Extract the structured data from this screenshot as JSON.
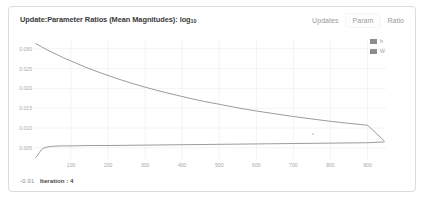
{
  "card": {
    "background": "#ffffff",
    "border_color": "#dcdcdc"
  },
  "header": {
    "title_main": "Update:Parameter Ratios (Mean Magnitudes): log",
    "title_subscript": "10",
    "tabs": [
      {
        "label": "Updates",
        "selected": false
      },
      {
        "label": "Param",
        "selected": true
      },
      {
        "label": "Ratio",
        "selected": false
      }
    ]
  },
  "legend": {
    "position": "top-right",
    "entries": [
      {
        "label": "b",
        "color": "#8c8c8c"
      },
      {
        "label": "W",
        "color": "#8c8c8c"
      }
    ]
  },
  "footer": {
    "value": "-0.91",
    "iteration_label": "Iteration : 4"
  },
  "colors": {
    "gridline": "#ebebeb",
    "axis_text": "#a8a8a8",
    "series_b": "#8f8f96",
    "series_w": "#8f8f96",
    "title_text": "#3a3a3a",
    "tab_text": "#9a9a9a"
  },
  "chart_data": {
    "type": "line",
    "title": "Update:Parameter Ratios (Mean Magnitudes): log10",
    "xlabel": "",
    "ylabel": "",
    "xlim": [
      0,
      950
    ],
    "ylim": [
      0.0022,
      0.0322
    ],
    "grid": true,
    "legend_position": "top-right",
    "xticks": [
      100,
      200,
      300,
      400,
      500,
      600,
      700,
      800,
      900
    ],
    "yticks": [
      0.005,
      0.01,
      0.015,
      0.02,
      0.025,
      0.03
    ],
    "ytick_labels": [
      "0.005",
      "0.010",
      "0.015",
      "0.020",
      "0.025",
      "0.030"
    ],
    "xtick_labels": [
      "100",
      "200",
      "300",
      "400",
      "500",
      "600",
      "700",
      "800",
      "900"
    ],
    "series": [
      {
        "name": "b",
        "color": "#8f8f96",
        "x": [
          5,
          20,
          40,
          60,
          80,
          100,
          140,
          180,
          220,
          260,
          300,
          340,
          380,
          420,
          460,
          500,
          550,
          600,
          650,
          700,
          750,
          800,
          850,
          900,
          945
        ],
        "y": [
          0.0313,
          0.0305,
          0.0295,
          0.0286,
          0.0277,
          0.0269,
          0.0253,
          0.0239,
          0.0226,
          0.0214,
          0.0203,
          0.0193,
          0.0184,
          0.0175,
          0.0167,
          0.016,
          0.0151,
          0.0143,
          0.0136,
          0.0129,
          0.0123,
          0.0117,
          0.0112,
          0.0107,
          0.0068
        ]
      },
      {
        "name": "W",
        "color": "#8f8f96",
        "x": [
          5,
          10,
          15,
          20,
          25,
          30,
          40,
          50,
          70,
          100,
          150,
          200,
          300,
          400,
          500,
          600,
          700,
          800,
          900,
          945
        ],
        "y": [
          0.0026,
          0.0032,
          0.0039,
          0.0045,
          0.0049,
          0.0051,
          0.0053,
          0.0054,
          0.0055,
          0.0055,
          0.0056,
          0.0056,
          0.0057,
          0.0058,
          0.0059,
          0.006,
          0.0061,
          0.0062,
          0.0063,
          0.0065
        ]
      }
    ]
  }
}
